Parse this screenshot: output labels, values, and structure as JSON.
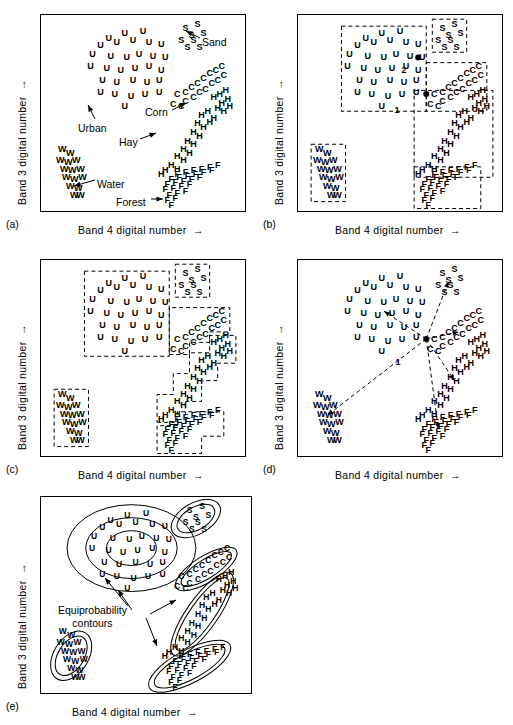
{
  "figure": {
    "axis_x_label": "Band 4 digital number",
    "axis_y_label": "Band 3 digital number",
    "panels": [
      {
        "id": "a",
        "label": "(a)"
      },
      {
        "id": "b",
        "label": "(b)"
      },
      {
        "id": "c",
        "label": "(c)"
      },
      {
        "id": "d",
        "label": "(d)"
      },
      {
        "id": "e",
        "label": "(e)"
      }
    ]
  },
  "labels": {
    "sand": "Sand",
    "corn": "Corn",
    "urban": "Urban",
    "hay": "Hay",
    "water": "Water",
    "forest": "Forest",
    "equiprobability": "Equiprobability",
    "contours": "contours",
    "point1": "1",
    "point2": "2"
  },
  "chart_data": {
    "type": "scatter",
    "title": "",
    "xlabel": "Band 4 digital number",
    "ylabel": "Band 3 digital number",
    "xlim": [
      0,
      100
    ],
    "ylim": [
      0,
      100
    ],
    "grid": false,
    "legend": "none",
    "note": "Five-panel scatterplot of spectral classes in Band 4 vs Band 3 feature space; panels show (a) raw class clusters, (b) parallelepiped boxes with unknown pixels 1 and 2, (c) stepped parallelepiped boundaries, (d) minimum-distance-to-means vectors from pixel 1, (e) equiprobability contours.",
    "series": [
      {
        "name": "Urban",
        "symbol": "U",
        "points": [
          [
            32,
            86
          ],
          [
            40,
            89
          ],
          [
            49,
            90
          ],
          [
            28,
            82
          ],
          [
            36,
            84
          ],
          [
            44,
            85
          ],
          [
            52,
            84
          ],
          [
            58,
            83
          ],
          [
            24,
            77
          ],
          [
            33,
            76
          ],
          [
            41,
            75
          ],
          [
            47,
            77
          ],
          [
            54,
            76
          ],
          [
            60,
            75
          ],
          [
            23,
            70
          ],
          [
            31,
            69
          ],
          [
            38,
            68
          ],
          [
            45,
            69
          ],
          [
            52,
            70
          ],
          [
            58,
            68
          ],
          [
            29,
            62
          ],
          [
            36,
            61
          ],
          [
            44,
            62
          ],
          [
            51,
            61
          ],
          [
            57,
            62
          ],
          [
            28,
            55
          ],
          [
            35,
            54
          ],
          [
            43,
            53
          ],
          [
            50,
            54
          ],
          [
            57,
            55
          ],
          [
            40,
            47
          ]
        ]
      },
      {
        "name": "Sand",
        "symbol": "S",
        "points": [
          [
            70,
            92
          ],
          [
            76,
            94
          ],
          [
            73,
            88
          ],
          [
            68,
            85
          ],
          [
            74,
            85
          ],
          [
            79,
            89
          ],
          [
            71,
            81
          ],
          [
            77,
            81
          ]
        ]
      },
      {
        "name": "Corn",
        "symbol": "C",
        "points": [
          [
            66,
            54
          ],
          [
            70,
            55
          ],
          [
            73,
            58
          ],
          [
            76,
            60
          ],
          [
            79,
            63
          ],
          [
            82,
            66
          ],
          [
            85,
            68
          ],
          [
            88,
            70
          ],
          [
            70,
            50
          ],
          [
            74,
            52
          ],
          [
            77,
            55
          ],
          [
            80,
            57
          ],
          [
            83,
            60
          ],
          [
            86,
            62
          ],
          [
            89,
            65
          ],
          [
            64,
            48
          ],
          [
            68,
            47
          ]
        ]
      },
      {
        "name": "Hay",
        "symbol": "H",
        "points": [
          [
            84,
            52
          ],
          [
            87,
            54
          ],
          [
            90,
            56
          ],
          [
            88,
            49
          ],
          [
            91,
            51
          ],
          [
            86,
            46
          ],
          [
            89,
            44
          ],
          [
            92,
            47
          ],
          [
            78,
            42
          ],
          [
            81,
            44
          ],
          [
            84,
            40
          ],
          [
            76,
            37
          ],
          [
            79,
            35
          ],
          [
            82,
            38
          ],
          [
            74,
            32
          ],
          [
            77,
            30
          ],
          [
            71,
            27
          ],
          [
            74,
            25
          ],
          [
            69,
            22
          ],
          [
            72,
            20
          ],
          [
            66,
            18
          ],
          [
            69,
            16
          ],
          [
            63,
            13
          ],
          [
            66,
            11
          ],
          [
            60,
            10
          ],
          [
            58,
            8
          ]
        ]
      },
      {
        "name": "Forest",
        "symbol": "F",
        "points": [
          [
            66,
            8
          ],
          [
            70,
            9
          ],
          [
            74,
            10
          ],
          [
            78,
            11
          ],
          [
            82,
            12
          ],
          [
            86,
            13
          ],
          [
            63,
            5
          ],
          [
            67,
            6
          ],
          [
            71,
            7
          ],
          [
            75,
            8
          ],
          [
            79,
            9
          ],
          [
            83,
            10
          ],
          [
            61,
            2
          ],
          [
            65,
            3
          ],
          [
            69,
            4
          ],
          [
            73,
            5
          ],
          [
            77,
            6
          ],
          [
            60,
            -1
          ],
          [
            64,
            0
          ],
          [
            68,
            1
          ],
          [
            72,
            2
          ],
          [
            62,
            -4
          ],
          [
            66,
            -3
          ],
          [
            70,
            -2
          ],
          [
            61,
            -7
          ],
          [
            65,
            -6
          ],
          [
            63,
            -10
          ]
        ]
      },
      {
        "name": "Water",
        "symbol": "W",
        "points": [
          [
            9,
            22
          ],
          [
            13,
            20
          ],
          [
            8,
            16
          ],
          [
            12,
            15
          ],
          [
            16,
            16
          ],
          [
            10,
            11
          ],
          [
            14,
            10
          ],
          [
            18,
            11
          ],
          [
            11,
            6
          ],
          [
            15,
            5
          ],
          [
            19,
            6
          ],
          [
            13,
            1
          ],
          [
            17,
            0
          ],
          [
            15,
            -4
          ],
          [
            18,
            -4
          ]
        ]
      }
    ],
    "unknown_pixels": [
      {
        "label": "1",
        "x": 62,
        "y": 54,
        "panel": "b"
      },
      {
        "label": "2",
        "x": 58,
        "y": 75,
        "panel": "b"
      },
      {
        "label": "1",
        "x": 62,
        "y": 54,
        "panel": "d"
      }
    ]
  }
}
